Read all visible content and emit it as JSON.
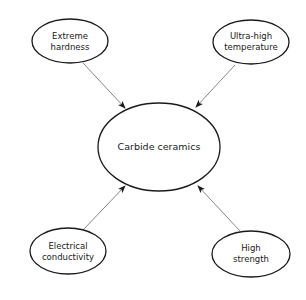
{
  "diagram": {
    "center": {
      "label": "Carbide ceramics"
    },
    "nodes": [
      {
        "id": "extreme-hardness",
        "lines": [
          "Extreme",
          "hardness"
        ]
      },
      {
        "id": "ultra-high-temperature",
        "lines": [
          "Ultra-high",
          "temperature"
        ]
      },
      {
        "id": "electrical-conductivity",
        "lines": [
          "Electrical",
          "conductivity"
        ]
      },
      {
        "id": "high-strength",
        "lines": [
          "High",
          "strength"
        ]
      }
    ],
    "edges": [
      {
        "from": "extreme-hardness",
        "to": "center"
      },
      {
        "from": "ultra-high-temperature",
        "to": "center"
      },
      {
        "from": "electrical-conductivity",
        "to": "center"
      },
      {
        "from": "high-strength",
        "to": "center"
      }
    ],
    "colors": {
      "stroke": "#1a1a1a",
      "arrow": "#555555",
      "background": "#ffffff"
    }
  }
}
